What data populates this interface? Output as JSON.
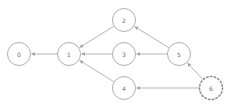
{
  "graph": {
    "type": "directed-graph",
    "width": 228,
    "height": 109,
    "background_color": "#ffffff",
    "edge_color": "#a2a2a2",
    "node_stroke_color": "#9a9a9a",
    "node_fill_color": "#ffffff",
    "label_color": "#6e6e6e",
    "nodes": [
      {
        "id": "0",
        "label": "0",
        "cx": 19,
        "cy": 54,
        "r": 11.5,
        "style": "solid"
      },
      {
        "id": "1",
        "label": "1",
        "cx": 69,
        "cy": 54,
        "r": 11.5,
        "style": "solid"
      },
      {
        "id": "2",
        "label": "2",
        "cx": 124,
        "cy": 20,
        "r": 11.5,
        "style": "solid"
      },
      {
        "id": "3",
        "label": "3",
        "cx": 124,
        "cy": 54,
        "r": 11.5,
        "style": "solid"
      },
      {
        "id": "4",
        "label": "4",
        "cx": 124,
        "cy": 88,
        "r": 11.5,
        "style": "solid"
      },
      {
        "id": "5",
        "label": "5",
        "cx": 179,
        "cy": 54,
        "r": 11.5,
        "style": "solid"
      },
      {
        "id": "6",
        "label": "6",
        "cx": 211,
        "cy": 88,
        "r": 11.5,
        "style": "dotted"
      }
    ],
    "edges": [
      {
        "from": "1",
        "to": "0",
        "directed": true
      },
      {
        "from": "2",
        "to": "1",
        "directed": true
      },
      {
        "from": "3",
        "to": "1",
        "directed": true
      },
      {
        "from": "4",
        "to": "1",
        "directed": true
      },
      {
        "from": "5",
        "to": "2",
        "directed": true
      },
      {
        "from": "5",
        "to": "3",
        "directed": true
      },
      {
        "from": "6",
        "to": "5",
        "directed": true
      },
      {
        "from": "6",
        "to": "4",
        "directed": true
      }
    ]
  }
}
